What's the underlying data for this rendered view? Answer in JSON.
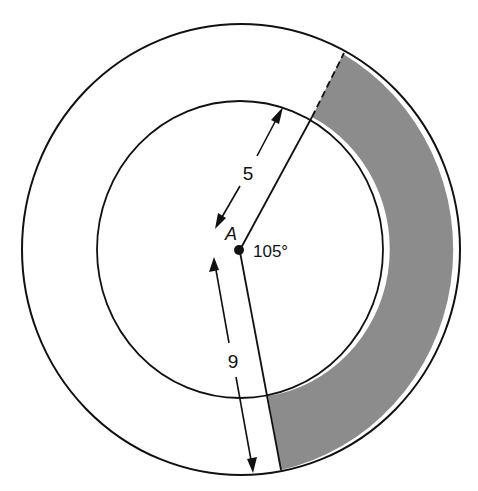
{
  "figure": {
    "center_label": "A",
    "angle_label": "105°",
    "inner_radius_label": "5",
    "outer_radius_label": "9"
  },
  "colors": {
    "stroke": "#111111",
    "shaded_region": "#8c8c8c",
    "background": "#ffffff"
  },
  "geometry": {
    "center": [
      240,
      250
    ],
    "outer_circle": {
      "cx": 241,
      "cy": 249.5,
      "rx": 219,
      "ry": 225.5
    },
    "inner_circle": {
      "cx": 240,
      "cy": 249.5,
      "rx": 143,
      "ry": 148.5
    },
    "central_angle_deg": 105
  }
}
